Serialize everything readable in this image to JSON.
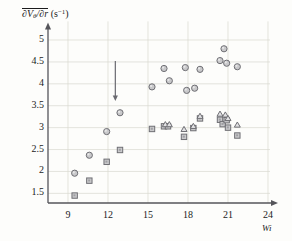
{
  "chart_data": {
    "type": "scatter",
    "title": "",
    "xlabel": "Wi",
    "ylabel": "dVθ/dr (s⁻¹)",
    "ylabel_parts": {
      "numerator": "∂V",
      "numerator_sub": "θ",
      "denominator": "∂r",
      "units_open": " (s",
      "units_exp": "−1",
      "units_close": ")"
    },
    "xlim": [
      7.5,
      24.6
    ],
    "ylim": [
      1.28,
      5.15
    ],
    "xticks": [
      9,
      12,
      15,
      18,
      21,
      24
    ],
    "yticks": [
      1.5,
      2,
      2.5,
      3,
      3.5,
      4,
      4.5,
      5
    ],
    "xtick_labels": [
      "9",
      "12",
      "15",
      "18",
      "21",
      "24"
    ],
    "ytick_labels": [
      "1.5",
      "2",
      "2.5",
      "3",
      "3.5",
      "4",
      "4.5",
      "5"
    ],
    "grid": true,
    "grid_color": "#d8d8d0",
    "axis_color": "#55555a",
    "marker_edge_color": "#6f6f74",
    "marker_fill_color": "#c9c9cb",
    "legend": "none",
    "series": [
      {
        "name": "circle-series",
        "marker": "circle",
        "points": [
          {
            "x": 9.5,
            "y": 1.96
          },
          {
            "x": 10.6,
            "y": 2.37
          },
          {
            "x": 11.9,
            "y": 2.91
          },
          {
            "x": 12.9,
            "y": 3.34
          },
          {
            "x": 15.3,
            "y": 3.93
          },
          {
            "x": 16.2,
            "y": 4.35
          },
          {
            "x": 16.6,
            "y": 4.07
          },
          {
            "x": 17.8,
            "y": 4.37
          },
          {
            "x": 17.9,
            "y": 3.85
          },
          {
            "x": 18.5,
            "y": 3.9
          },
          {
            "x": 18.9,
            "y": 4.33
          },
          {
            "x": 20.4,
            "y": 4.53
          },
          {
            "x": 20.7,
            "y": 4.8
          },
          {
            "x": 20.9,
            "y": 4.47
          },
          {
            "x": 21.7,
            "y": 4.39
          }
        ]
      },
      {
        "name": "square-series",
        "marker": "square",
        "points": [
          {
            "x": 9.5,
            "y": 1.45
          },
          {
            "x": 10.6,
            "y": 1.79
          },
          {
            "x": 11.9,
            "y": 2.22
          },
          {
            "x": 12.9,
            "y": 2.49
          },
          {
            "x": 15.3,
            "y": 2.97
          },
          {
            "x": 16.2,
            "y": 3.03
          },
          {
            "x": 16.5,
            "y": 3.03
          },
          {
            "x": 17.7,
            "y": 2.79
          },
          {
            "x": 18.4,
            "y": 2.99
          },
          {
            "x": 18.9,
            "y": 3.21
          },
          {
            "x": 20.4,
            "y": 3.18
          },
          {
            "x": 20.6,
            "y": 3.08
          },
          {
            "x": 20.9,
            "y": 3.17
          },
          {
            "x": 21.0,
            "y": 3.0
          },
          {
            "x": 21.7,
            "y": 2.82
          }
        ]
      },
      {
        "name": "triangle-series",
        "marker": "triangle",
        "points": [
          {
            "x": 16.3,
            "y": 3.08
          },
          {
            "x": 16.6,
            "y": 3.08
          },
          {
            "x": 17.7,
            "y": 2.97
          },
          {
            "x": 18.4,
            "y": 3.04
          },
          {
            "x": 18.9,
            "y": 3.27
          },
          {
            "x": 20.4,
            "y": 3.32
          },
          {
            "x": 20.8,
            "y": 3.3
          },
          {
            "x": 21.0,
            "y": 3.22
          },
          {
            "x": 21.7,
            "y": 3.07
          }
        ]
      }
    ],
    "annotations": [
      {
        "name": "downward-arrow",
        "type": "arrow",
        "x": 12.55,
        "y_start": 4.52,
        "y_end": 3.64,
        "direction": "down",
        "color": "#6a6a70"
      }
    ]
  }
}
